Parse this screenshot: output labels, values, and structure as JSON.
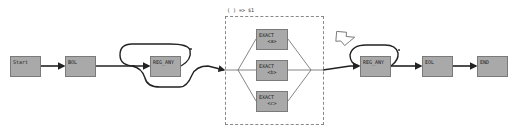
{
  "diagram": {
    "type": "regex-railroad",
    "colors": {
      "node_fill": "#a9a9a9",
      "node_border": "#7a7a7a",
      "edge": "#222222",
      "group_border": "#888888",
      "background": "#ffffff"
    },
    "nodes": {
      "start": {
        "label": "Start"
      },
      "bol": {
        "label": "BOL"
      },
      "reg_any_1": {
        "label": "REG_ANY",
        "quantifier": "*"
      },
      "exact_a": {
        "label": "EXACT",
        "value": "<a>"
      },
      "exact_b": {
        "label": "EXACT",
        "value": "<b>"
      },
      "exact_c": {
        "label": "EXACT",
        "value": "<c>"
      },
      "reg_any_2": {
        "label": "REG_ANY",
        "quantifier": "*"
      },
      "eol": {
        "label": "EOL"
      },
      "end": {
        "label": "END"
      }
    },
    "group": {
      "label": "( ) => $1"
    },
    "pointer": {
      "icon": "hollow-arrow-icon",
      "target": "reg_any_2"
    },
    "edges": [
      [
        "start",
        "bol"
      ],
      [
        "bol",
        "reg_any_1"
      ],
      [
        "reg_any_1",
        "group"
      ],
      [
        "group",
        "exact_a"
      ],
      [
        "group",
        "exact_b"
      ],
      [
        "group",
        "exact_c"
      ],
      [
        "group",
        "reg_any_2"
      ],
      [
        "reg_any_2",
        "eol"
      ],
      [
        "eol",
        "end"
      ]
    ]
  }
}
